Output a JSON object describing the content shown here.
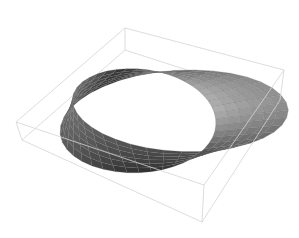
{
  "chart_data": {
    "type": "surface3d",
    "title": "",
    "xlabel": "",
    "ylabel": "",
    "zlabel": "",
    "axes_ticks": false,
    "bounding_box": true,
    "grid": false,
    "legend": null,
    "parametric": {
      "x": "(R + v*cos(u/2))*cos(u)",
      "y": "(R + v*cos(u/2))*sin(u)",
      "z": "v*sin(u/2)",
      "R": 1.0,
      "u_range": [
        0,
        6.2832
      ],
      "v_range": [
        -0.4,
        0.4
      ],
      "u_steps": 40,
      "v_steps": 6
    },
    "shading": {
      "light": "#b8b8b8",
      "mid": "#8e8e8e",
      "dark": "#2e2e2e"
    },
    "mesh_color": "#6a6a6a",
    "box_color": "#d4d4d4",
    "box_corners_2d": {
      "back_top": [
        125,
        28
      ],
      "back_bottom": [
        125,
        50
      ],
      "right_top": [
        284,
        70
      ],
      "right_bottom": [
        280,
        100
      ],
      "left_top": [
        16,
        122
      ],
      "left_bottom": [
        22,
        140
      ],
      "front_top": [
        204,
        185
      ],
      "front_bottom": [
        202,
        222
      ]
    }
  }
}
